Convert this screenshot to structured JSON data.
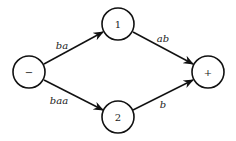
{
  "diagram": {
    "type": "automaton",
    "nodes": [
      {
        "id": "minus",
        "label": "−"
      },
      {
        "id": "n1",
        "label": "1"
      },
      {
        "id": "n2",
        "label": "2"
      },
      {
        "id": "plus",
        "label": "+"
      }
    ],
    "edges": [
      {
        "from": "minus",
        "to": "n1",
        "label": "ba"
      },
      {
        "from": "minus",
        "to": "n2",
        "label": "baa"
      },
      {
        "from": "n1",
        "to": "plus",
        "label": "ab"
      },
      {
        "from": "n2",
        "to": "plus",
        "label": "b"
      }
    ]
  }
}
